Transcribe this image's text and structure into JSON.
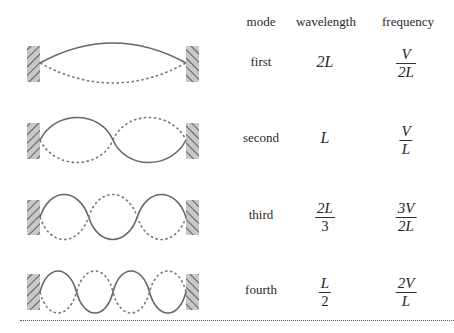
{
  "table": {
    "headers": {
      "mode": "mode",
      "wavelength": "wavelength",
      "frequency": "frequency"
    },
    "rows": [
      {
        "mode": "first",
        "wavelength": {
          "num": "2L",
          "den": null
        },
        "frequency": {
          "num": "V",
          "den": "2L"
        },
        "harmonic": 1
      },
      {
        "mode": "second",
        "wavelength": {
          "num": "L",
          "den": null
        },
        "frequency": {
          "num": "V",
          "den": "L"
        },
        "harmonic": 2
      },
      {
        "mode": "third",
        "wavelength": {
          "num": "2L",
          "den": "3"
        },
        "frequency": {
          "num": "3V",
          "den": "2L"
        },
        "harmonic": 3
      },
      {
        "mode": "fourth",
        "wavelength": {
          "num": "L",
          "den": "2"
        },
        "frequency": {
          "num": "2V",
          "den": "L"
        },
        "harmonic": 4
      }
    ]
  },
  "colors": {
    "string": "#666666",
    "wall_fill": "#c8c8c8",
    "wall_hatch": "#444444",
    "rule": "#555555"
  }
}
